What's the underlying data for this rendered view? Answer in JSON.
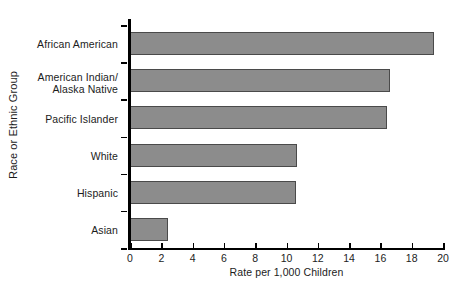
{
  "chart_data": {
    "type": "bar",
    "orientation": "horizontal",
    "title": "",
    "xlabel": "Rate per 1,000 Children",
    "ylabel": "Race or Ethnic Group",
    "categories": [
      "African American",
      "American Indian/\nAlaska Native",
      "Pacific Islander",
      "White",
      "Hispanic",
      "Asian"
    ],
    "values": [
      19.4,
      16.6,
      16.4,
      10.7,
      10.6,
      2.4
    ],
    "xlim": [
      0,
      20
    ],
    "xticks": [
      0,
      2,
      4,
      6,
      8,
      10,
      12,
      14,
      16,
      18,
      20
    ],
    "xtick_labels": [
      "0",
      "2",
      "4",
      "6",
      "8",
      "10",
      "12",
      "14",
      "16",
      "18",
      "20"
    ],
    "grid": false,
    "legend": false,
    "bar_color": "#8c8c8c",
    "bar_edge_color": "#4a4a4a",
    "axis_color": "#000000"
  },
  "labels": {
    "cat_0": "African American",
    "cat_1_line1": "American Indian/",
    "cat_1_line2": "Alaska Native",
    "cat_2": "Pacific Islander",
    "cat_3": "White",
    "cat_4": "Hispanic",
    "cat_5": "Asian"
  }
}
